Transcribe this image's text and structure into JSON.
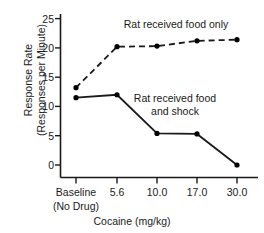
{
  "chart_data": {
    "type": "line",
    "title": "",
    "xlabel": "Cocaine (mg/kg)",
    "ylabel_line1": "Response Rate",
    "ylabel_line2": "(Responses per Minute)",
    "categories": [
      "Baseline",
      "5.6",
      "10.0",
      "17.0",
      "30.0"
    ],
    "category_sublabels": [
      "(No Drug)",
      "",
      "",
      "",
      ""
    ],
    "yticks": [
      0,
      5,
      10,
      15,
      20,
      25
    ],
    "ytick_labels": [
      "0",
      "5",
      "10",
      "15",
      "20",
      "25"
    ],
    "ylim": [
      0,
      25
    ],
    "grid": false,
    "legend_position": "inline-annotations",
    "series": [
      {
        "name": "Rat received food only",
        "style": "dashed",
        "marker": "filled-circle",
        "color": "#000000",
        "values": [
          13.2,
          20.2,
          20.3,
          21.2,
          21.4
        ]
      },
      {
        "name": "Rat received food and shock",
        "style": "solid",
        "marker": "filled-circle",
        "color": "#000000",
        "values": [
          11.5,
          12.0,
          5.4,
          5.3,
          0.0
        ]
      }
    ],
    "annotations": [
      {
        "text": "Rat received food only",
        "series": "Rat received food only"
      },
      {
        "text_line1": "Rat received food",
        "text_line2": "and shock",
        "series": "Rat received food and shock"
      }
    ]
  }
}
